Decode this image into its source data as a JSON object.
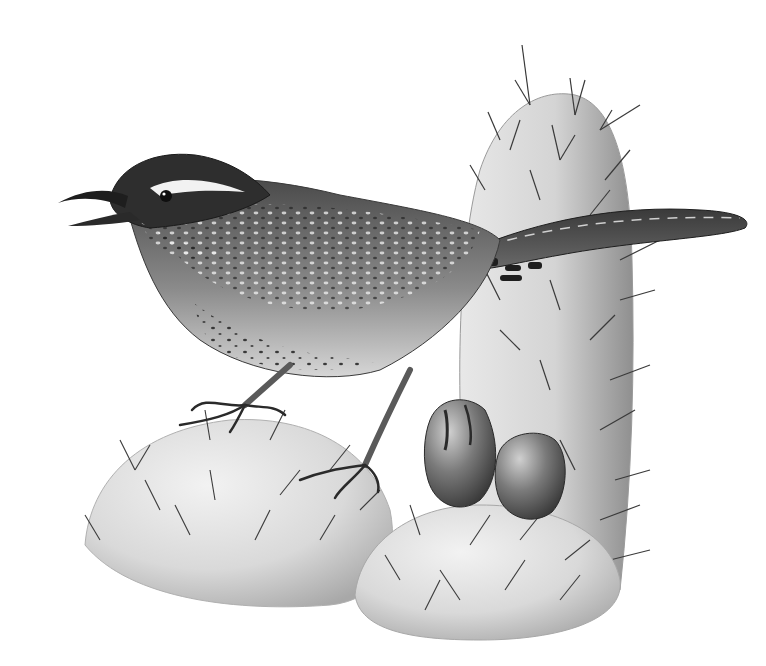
{
  "image": {
    "description": "Pencil drawing of a cactus wren perched on prickly pear cactus pads",
    "subject": "cactus wren",
    "medium": "graphite pencil",
    "background_color": "#ffffff",
    "palette": {
      "paper": "#ffffff",
      "cactus_light": "#e6e6e6",
      "cactus_mid": "#cfcfcf",
      "cactus_shadow": "#9a9a9a",
      "bird_dark": "#2a2a2a",
      "bird_mid": "#6e6e6e",
      "bird_light": "#d8d8d8",
      "spine": "#3a3a3a"
    },
    "elements": [
      {
        "name": "tall-cactus-pad",
        "position": "right-center"
      },
      {
        "name": "left-cactus-pad",
        "position": "bottom-left"
      },
      {
        "name": "bottom-cactus-pad",
        "position": "bottom-center"
      },
      {
        "name": "cactus-fruits",
        "count": 2,
        "position": "center-right"
      },
      {
        "name": "wren-bird",
        "pose": "perched, beak open, singing, facing left"
      }
    ]
  }
}
